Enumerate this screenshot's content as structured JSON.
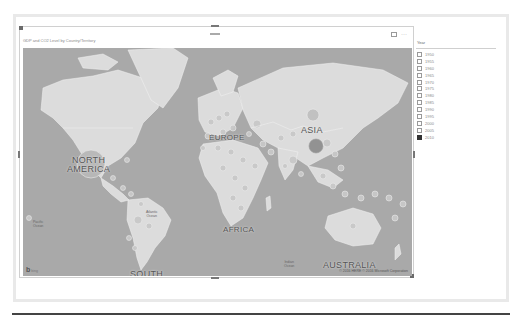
{
  "visual": {
    "title": "GDP and CO2 Level by Country/Territory",
    "actions": [
      {
        "name": "focus-mode",
        "icon": "focus-mode-icon"
      },
      {
        "name": "more-options",
        "icon": "more-options-icon",
        "glyph": "···"
      }
    ],
    "map": {
      "regions": [
        {
          "label": "NORTH AMERICA",
          "lines": [
            "NORTH",
            "AMERICA"
          ]
        },
        {
          "label": "EUROPE",
          "lines": [
            "EUROPE"
          ]
        },
        {
          "label": "ASIA",
          "lines": [
            "ASIA"
          ]
        },
        {
          "label": "AFRICA",
          "lines": [
            "AFRICA"
          ]
        },
        {
          "label": "SOUTH AMERICA",
          "lines": [
            "SOUTH",
            "AMERICA"
          ]
        },
        {
          "label": "AUSTRALIA",
          "lines": [
            "AUSTRALIA"
          ]
        }
      ],
      "oceans": [
        {
          "label": "Pacific Ocean",
          "lines": [
            "Pacific",
            "Ocean"
          ]
        },
        {
          "label": "Atlantic Ocean",
          "lines": [
            "Atlantic",
            "Ocean"
          ]
        },
        {
          "label": "Indian Ocean",
          "lines": [
            "Indian",
            "Ocean"
          ]
        },
        {
          "label": "Pacific Ocean (east)",
          "lines": [
            "Pacific Ocean"
          ]
        }
      ],
      "provider_logo": "b",
      "provider_name": "bing",
      "attribution": "© 2016 HERE  © 2016 Microsoft Corporation"
    }
  },
  "slicer": {
    "title": "Year",
    "items": [
      {
        "label": "1950",
        "checked": false
      },
      {
        "label": "1955",
        "checked": false
      },
      {
        "label": "1960",
        "checked": false
      },
      {
        "label": "1965",
        "checked": false
      },
      {
        "label": "1970",
        "checked": false
      },
      {
        "label": "1975",
        "checked": false
      },
      {
        "label": "1980",
        "checked": false
      },
      {
        "label": "1985",
        "checked": false
      },
      {
        "label": "1990",
        "checked": false
      },
      {
        "label": "1995",
        "checked": false
      },
      {
        "label": "2000",
        "checked": false
      },
      {
        "label": "2005",
        "checked": false
      },
      {
        "label": "2010",
        "checked": true
      }
    ]
  },
  "colors": {
    "ocean": "#a9a9a9",
    "land": "#dcdcdc",
    "bubble": "#b5b5b5",
    "bubble_large": "#8f8f8f",
    "checked": "#333333"
  }
}
